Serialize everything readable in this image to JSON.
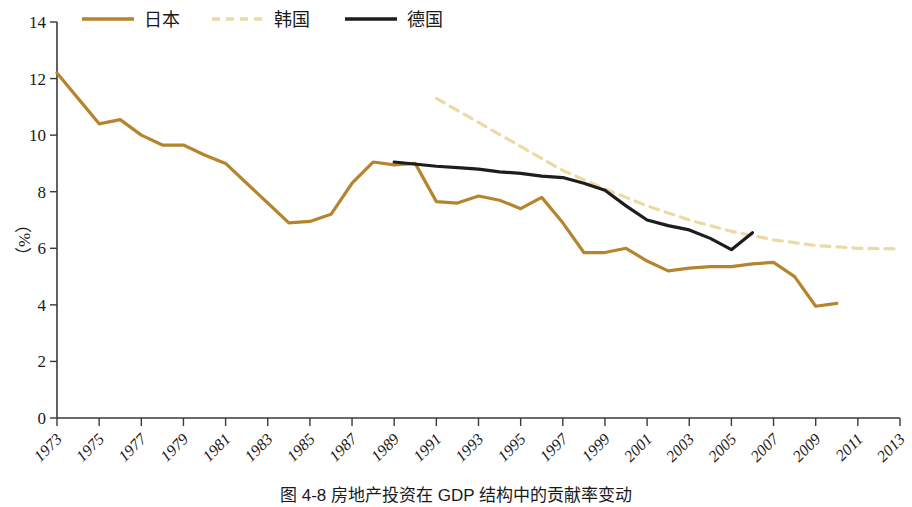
{
  "caption": "图 4-8  房地产投资在 GDP 结构中的贡献率变动",
  "colors": {
    "japan": "#b5852e",
    "korea": "#edd9a3",
    "germany": "#1d1d1d",
    "axis": "#3a3a3a",
    "background": "#ffffff"
  },
  "legend": {
    "position": "top",
    "items": [
      {
        "label": "日本",
        "style": "solid",
        "color": "#b5852e",
        "key": "japan"
      },
      {
        "label": "韩国",
        "style": "dashed",
        "color": "#edd9a3",
        "key": "korea"
      },
      {
        "label": "德国",
        "style": "solid",
        "color": "#1d1d1d",
        "key": "germany"
      }
    ]
  },
  "chart_data": {
    "type": "line",
    "title": "图 4-8  房地产投资在 GDP 结构中的贡献率变动",
    "xlabel": "",
    "ylabel": "（%）",
    "ylim": [
      0,
      14
    ],
    "yticks": [
      0,
      2,
      4,
      6,
      8,
      10,
      12,
      14
    ],
    "xlim": [
      1973,
      2013
    ],
    "xticks": [
      1973,
      1975,
      1977,
      1979,
      1981,
      1983,
      1985,
      1987,
      1989,
      1991,
      1993,
      1995,
      1997,
      1999,
      2001,
      2003,
      2005,
      2007,
      2009,
      2011,
      2013
    ],
    "grid": false,
    "legend_position": "top",
    "series": [
      {
        "name": "日本",
        "color": "#b5852e",
        "style": "solid",
        "x": [
          1973,
          1974,
          1975,
          1976,
          1977,
          1978,
          1979,
          1980,
          1981,
          1982,
          1983,
          1984,
          1985,
          1986,
          1987,
          1988,
          1989,
          1990,
          1991,
          1992,
          1993,
          1994,
          1995,
          1996,
          1997,
          1998,
          1999,
          2000,
          2001,
          2002,
          2003,
          2004,
          2005,
          2006,
          2007,
          2008,
          2009,
          2010
        ],
        "y": [
          12.2,
          11.3,
          10.4,
          10.55,
          10.0,
          9.65,
          9.65,
          9.3,
          9.0,
          8.3,
          7.6,
          6.9,
          6.95,
          7.2,
          8.3,
          9.05,
          8.95,
          9.0,
          7.65,
          7.6,
          7.85,
          7.7,
          7.4,
          7.8,
          6.9,
          5.85,
          5.85,
          6.0,
          5.55,
          5.2,
          5.3,
          5.35,
          5.35,
          5.45,
          5.5,
          5.0,
          3.95,
          4.05
        ]
      },
      {
        "name": "韩国",
        "color": "#edd9a3",
        "style": "dashed",
        "x": [
          1991,
          1993,
          1995,
          1997,
          1999,
          2001,
          2003,
          2005,
          2007,
          2009,
          2011,
          2013
        ],
        "y": [
          11.3,
          10.45,
          9.6,
          8.75,
          8.1,
          7.5,
          7.0,
          6.6,
          6.3,
          6.1,
          6.0,
          5.98
        ]
      },
      {
        "name": "德国",
        "color": "#1d1d1d",
        "style": "solid",
        "x": [
          1989,
          1991,
          1992,
          1993,
          1994,
          1995,
          1996,
          1997,
          1998,
          1999,
          2000,
          2001,
          2002,
          2003,
          2004,
          2005,
          2006
        ],
        "y": [
          9.05,
          8.9,
          8.85,
          8.8,
          8.7,
          8.65,
          8.55,
          8.5,
          8.3,
          8.05,
          7.5,
          7.0,
          6.8,
          6.65,
          6.35,
          5.95,
          6.55
        ]
      }
    ]
  }
}
